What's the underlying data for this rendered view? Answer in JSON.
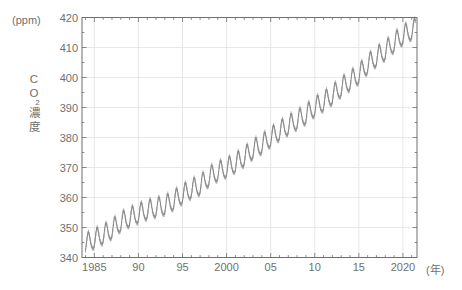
{
  "chart_data": {
    "type": "line",
    "title": "",
    "subtitle": "",
    "xlabel": "(年)",
    "ylabel": "CO₂濃度",
    "yunit": "(ppm)",
    "xlim": [
      1983.6,
      2021.6
    ],
    "ylim": [
      340,
      420
    ],
    "grid": true,
    "legend": false,
    "ytick_labels": [
      "420",
      "410",
      "400",
      "390",
      "380",
      "370",
      "360",
      "350",
      "340"
    ],
    "ytick_values": [
      420,
      410,
      400,
      390,
      380,
      370,
      360,
      350,
      340
    ],
    "xtick_labels": [
      "1985",
      "90",
      "95",
      "2000",
      "05",
      "10",
      "15",
      "2020"
    ],
    "xtick_values": [
      1985,
      1990,
      1995,
      2000,
      2005,
      2010,
      2015,
      2020
    ],
    "minor_xtick_interval": 1,
    "series_name": "CO2 concentration (monthly mean)",
    "line_color": "#8a8a8a",
    "marker": "vertical-tick",
    "seasonal_amplitude_ppm": 3.2,
    "seasonal_peak_month": 5,
    "seasonal_trough_month": 9,
    "annual_values": [
      {
        "year": 1984,
        "value": 344.4
      },
      {
        "year": 1985,
        "value": 346.0
      },
      {
        "year": 1986,
        "value": 347.4
      },
      {
        "year": 1987,
        "value": 349.2
      },
      {
        "year": 1988,
        "value": 351.6
      },
      {
        "year": 1989,
        "value": 353.1
      },
      {
        "year": 1990,
        "value": 354.4
      },
      {
        "year": 1991,
        "value": 355.6
      },
      {
        "year": 1992,
        "value": 356.4
      },
      {
        "year": 1993,
        "value": 357.1
      },
      {
        "year": 1994,
        "value": 358.8
      },
      {
        "year": 1995,
        "value": 360.8
      },
      {
        "year": 1996,
        "value": 362.6
      },
      {
        "year": 1997,
        "value": 363.8
      },
      {
        "year": 1998,
        "value": 366.7
      },
      {
        "year": 1999,
        "value": 368.4
      },
      {
        "year": 2000,
        "value": 369.6
      },
      {
        "year": 2001,
        "value": 371.2
      },
      {
        "year": 2002,
        "value": 373.3
      },
      {
        "year": 2003,
        "value": 375.8
      },
      {
        "year": 2004,
        "value": 377.5
      },
      {
        "year": 2005,
        "value": 379.8
      },
      {
        "year": 2006,
        "value": 381.9
      },
      {
        "year": 2007,
        "value": 383.8
      },
      {
        "year": 2008,
        "value": 385.6
      },
      {
        "year": 2009,
        "value": 387.4
      },
      {
        "year": 2010,
        "value": 389.9
      },
      {
        "year": 2011,
        "value": 391.7
      },
      {
        "year": 2012,
        "value": 393.9
      },
      {
        "year": 2013,
        "value": 396.5
      },
      {
        "year": 2014,
        "value": 398.6
      },
      {
        "year": 2015,
        "value": 400.8
      },
      {
        "year": 2016,
        "value": 404.2
      },
      {
        "year": 2017,
        "value": 406.6
      },
      {
        "year": 2018,
        "value": 408.7
      },
      {
        "year": 2019,
        "value": 411.4
      },
      {
        "year": 2020,
        "value": 413.9
      },
      {
        "year": 2021,
        "value": 415.5
      }
    ]
  }
}
